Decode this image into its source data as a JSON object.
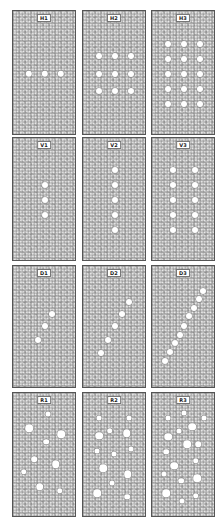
{
  "figure": {
    "background": "#ffffff",
    "texture_color": "#9a9a9a",
    "hole_color": "#ffffff",
    "panels": [
      {
        "id": "H1",
        "label": "H1",
        "row": 0,
        "col": 0,
        "dots": [
          [
            0.25,
            0.5,
            3.2
          ],
          [
            0.5,
            0.5,
            3.2
          ],
          [
            0.75,
            0.5,
            3.2
          ]
        ]
      },
      {
        "id": "H2",
        "label": "H2",
        "row": 0,
        "col": 1,
        "dots": [
          [
            0.25,
            0.36,
            3
          ],
          [
            0.5,
            0.36,
            3
          ],
          [
            0.75,
            0.36,
            3
          ],
          [
            0.25,
            0.5,
            3
          ],
          [
            0.5,
            0.5,
            3
          ],
          [
            0.75,
            0.5,
            3
          ],
          [
            0.25,
            0.64,
            3
          ],
          [
            0.5,
            0.64,
            3
          ],
          [
            0.75,
            0.64,
            3
          ]
        ]
      },
      {
        "id": "H3",
        "label": "H3",
        "row": 0,
        "col": 2,
        "dots": [
          [
            0.25,
            0.26,
            3
          ],
          [
            0.5,
            0.26,
            3
          ],
          [
            0.75,
            0.26,
            3
          ],
          [
            0.25,
            0.38,
            3
          ],
          [
            0.5,
            0.38,
            3
          ],
          [
            0.75,
            0.38,
            3
          ],
          [
            0.25,
            0.5,
            3
          ],
          [
            0.5,
            0.5,
            3
          ],
          [
            0.75,
            0.5,
            3
          ],
          [
            0.25,
            0.62,
            3
          ],
          [
            0.5,
            0.62,
            3
          ],
          [
            0.75,
            0.62,
            3
          ],
          [
            0.25,
            0.74,
            3
          ],
          [
            0.5,
            0.74,
            3
          ],
          [
            0.75,
            0.74,
            3
          ]
        ]
      },
      {
        "id": "V1",
        "label": "V1",
        "row": 1,
        "col": 0,
        "dots": [
          [
            0.5,
            0.38,
            3
          ],
          [
            0.5,
            0.5,
            3
          ],
          [
            0.5,
            0.62,
            3
          ]
        ]
      },
      {
        "id": "V2",
        "label": "V2",
        "row": 1,
        "col": 1,
        "dots": [
          [
            0.5,
            0.26,
            3
          ],
          [
            0.5,
            0.38,
            3
          ],
          [
            0.5,
            0.5,
            3
          ],
          [
            0.5,
            0.62,
            3
          ],
          [
            0.5,
            0.74,
            3
          ]
        ]
      },
      {
        "id": "V3",
        "label": "V3",
        "row": 1,
        "col": 2,
        "dots": [
          [
            0.33,
            0.26,
            3
          ],
          [
            0.67,
            0.26,
            3
          ],
          [
            0.33,
            0.38,
            3
          ],
          [
            0.67,
            0.38,
            3
          ],
          [
            0.33,
            0.5,
            3
          ],
          [
            0.67,
            0.5,
            3
          ],
          [
            0.33,
            0.62,
            3
          ],
          [
            0.67,
            0.62,
            3
          ],
          [
            0.33,
            0.74,
            3
          ],
          [
            0.67,
            0.74,
            3
          ]
        ]
      },
      {
        "id": "D1",
        "label": "D1",
        "row": 2,
        "col": 0,
        "dots": [
          [
            0.61,
            0.39,
            3
          ],
          [
            0.5,
            0.49,
            3
          ],
          [
            0.39,
            0.6,
            3
          ]
        ]
      },
      {
        "id": "D2",
        "label": "D2",
        "row": 2,
        "col": 1,
        "dots": [
          [
            0.72,
            0.29,
            3
          ],
          [
            0.61,
            0.39,
            3
          ],
          [
            0.5,
            0.49,
            3
          ],
          [
            0.39,
            0.6,
            3
          ],
          [
            0.28,
            0.71,
            3
          ]
        ]
      },
      {
        "id": "D3",
        "label": "D3",
        "row": 2,
        "col": 2,
        "dots": [
          [
            0.8,
            0.2,
            3
          ],
          [
            0.73,
            0.27,
            3
          ],
          [
            0.65,
            0.34,
            3
          ],
          [
            0.58,
            0.41,
            3
          ],
          [
            0.5,
            0.49,
            3
          ],
          [
            0.43,
            0.56,
            3
          ],
          [
            0.36,
            0.63,
            3
          ],
          [
            0.28,
            0.7,
            3
          ],
          [
            0.21,
            0.77,
            3
          ]
        ]
      },
      {
        "id": "R1",
        "label": "R1",
        "row": 3,
        "col": 0,
        "dots": [
          [
            0.55,
            0.17,
            2.5
          ],
          [
            0.25,
            0.28,
            3.8
          ],
          [
            0.75,
            0.33,
            3.8
          ],
          [
            0.52,
            0.39,
            2.8
          ],
          [
            0.33,
            0.53,
            2.8
          ],
          [
            0.67,
            0.57,
            3.8
          ],
          [
            0.17,
            0.63,
            2.8
          ],
          [
            0.42,
            0.75,
            3.8
          ],
          [
            0.73,
            0.78,
            2.8
          ]
        ]
      },
      {
        "id": "R2",
        "label": "R2",
        "row": 3,
        "col": 1,
        "dots": [
          [
            0.25,
            0.2,
            2.5
          ],
          [
            0.72,
            0.2,
            2.5
          ],
          [
            0.25,
            0.34,
            3.8
          ],
          [
            0.42,
            0.3,
            2.8
          ],
          [
            0.68,
            0.32,
            3.8
          ],
          [
            0.22,
            0.46,
            2.5
          ],
          [
            0.49,
            0.49,
            2.5
          ],
          [
            0.75,
            0.45,
            2.5
          ],
          [
            0.32,
            0.6,
            3.8
          ],
          [
            0.7,
            0.65,
            3.8
          ],
          [
            0.45,
            0.72,
            2.5
          ],
          [
            0.22,
            0.8,
            3.8
          ],
          [
            0.69,
            0.83,
            2.8
          ]
        ]
      },
      {
        "id": "R3",
        "label": "R3",
        "row": 3,
        "col": 2,
        "dots": [
          [
            0.25,
            0.2,
            2.5
          ],
          [
            0.5,
            0.16,
            2.5
          ],
          [
            0.82,
            0.2,
            2.5
          ],
          [
            0.63,
            0.27,
            3.8
          ],
          [
            0.42,
            0.3,
            2.5
          ],
          [
            0.25,
            0.35,
            3.8
          ],
          [
            0.55,
            0.41,
            3.8
          ],
          [
            0.72,
            0.41,
            2.8
          ],
          [
            0.22,
            0.47,
            2.8
          ],
          [
            0.35,
            0.58,
            3.8
          ],
          [
            0.68,
            0.54,
            2.8
          ],
          [
            0.18,
            0.65,
            2.5
          ],
          [
            0.46,
            0.7,
            2.8
          ],
          [
            0.71,
            0.68,
            3.8
          ],
          [
            0.22,
            0.8,
            3.8
          ],
          [
            0.47,
            0.86,
            2.5
          ],
          [
            0.68,
            0.82,
            2.8
          ]
        ]
      }
    ],
    "layout": {
      "col_x": [
        12,
        82,
        151
      ],
      "row_y": [
        10,
        137,
        265,
        392
      ],
      "panel_w": 64,
      "row_h": [
        125,
        124,
        123,
        125
      ]
    }
  }
}
